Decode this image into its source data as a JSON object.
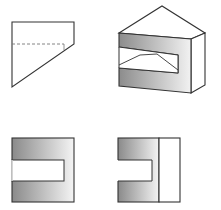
{
  "figure": {
    "title": "Orthographic and isometric views of a notched block with sloped top",
    "colors": {
      "background": "#ffffff",
      "stroke": "#333333",
      "hidden_line": "#777777",
      "shade_dark": "#8a8a8a",
      "shade_light": "#f4f4f4"
    },
    "views": [
      {
        "id": "top-left",
        "name": "side view (trapezoid with hidden line)"
      },
      {
        "id": "top-right",
        "name": "isometric view"
      },
      {
        "id": "bottom-left",
        "name": "front view"
      },
      {
        "id": "bottom-right",
        "name": "side elevation view"
      }
    ]
  }
}
